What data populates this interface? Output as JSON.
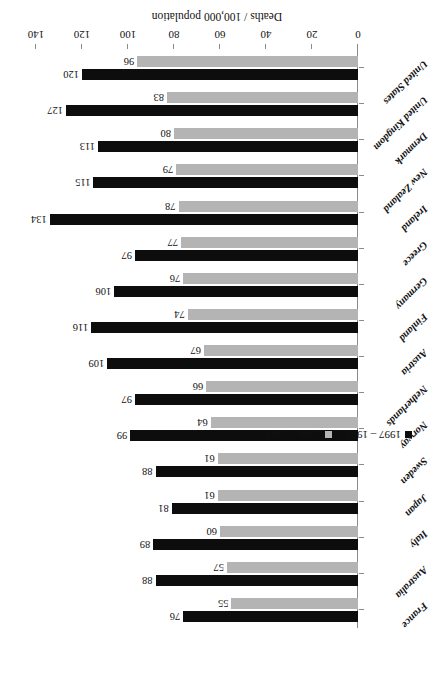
{
  "chart_data": {
    "type": "bar",
    "orientation": "horizontal",
    "title": "",
    "xlabel": "Deaths / 100,000 population",
    "ylabel": "",
    "xlim": [
      0,
      140
    ],
    "xticks": [
      0,
      20,
      40,
      60,
      80,
      100,
      120,
      140
    ],
    "grid": false,
    "legend_position": "left",
    "rotation_note": "figure rendered upside-down (180 degrees)",
    "categories": [
      "France",
      "Australia",
      "Italy",
      "Japan",
      "Sweden",
      "Norway",
      "Netherlands",
      "Austria",
      "Finland",
      "Germany",
      "Greece",
      "Ireland",
      "New Zealand",
      "Denmark",
      "United Kingdom",
      "United States"
    ],
    "series": [
      {
        "name": "1997 – 1998",
        "color": "#0d0d0d",
        "values": [
          76,
          88,
          89,
          81,
          88,
          99,
          97,
          109,
          116,
          106,
          97,
          134,
          115,
          113,
          127,
          120
        ]
      },
      {
        "name": "2006 – 2007",
        "color": "#b4b4b4",
        "values": [
          55,
          57,
          60,
          61,
          61,
          64,
          66,
          67,
          74,
          76,
          77,
          78,
          79,
          80,
          83,
          96
        ]
      }
    ]
  },
  "legend": {
    "entries": [
      {
        "label": "1997 – 1998",
        "color": "#0d0d0d"
      },
      {
        "label": "2006 – 2007",
        "color": "#b4b4b4"
      }
    ]
  },
  "axis": {
    "title": "Deaths / 100,000 population",
    "tick_labels": [
      "0",
      "20",
      "40",
      "60",
      "80",
      "100",
      "120",
      "140"
    ]
  }
}
